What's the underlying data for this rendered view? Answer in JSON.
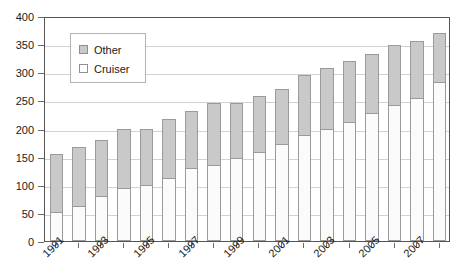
{
  "chart_data": {
    "type": "bar",
    "title": "",
    "subtitle": "",
    "xlabel": "",
    "ylabel": "",
    "stacked": true,
    "grid": true,
    "legend_position": "top-left-inside",
    "ylim": [
      0,
      400
    ],
    "ytick_labels": [
      "400",
      "350",
      "300",
      "250",
      "200",
      "150",
      "100",
      "50",
      "0"
    ],
    "ytick_values": [
      400,
      350,
      300,
      250,
      200,
      150,
      100,
      50,
      0
    ],
    "categories": [
      "1991",
      "1992",
      "1993",
      "1994",
      "1995",
      "1996",
      "1997",
      "1998",
      "1999",
      "2000",
      "2001",
      "2002",
      "2003",
      "2004",
      "2005",
      "2006",
      "2007",
      "2008"
    ],
    "visible_xtick_labels": [
      "1991",
      "1993",
      "1995",
      "1997",
      "1999",
      "2001",
      "2003",
      "2005",
      "2007"
    ],
    "series": [
      {
        "name": "Cruiser",
        "color": "#fbfbfb",
        "values": [
          52,
          62,
          80,
          95,
          100,
          112,
          130,
          135,
          148,
          158,
          172,
          188,
          200,
          212,
          228,
          242,
          255,
          283
        ]
      },
      {
        "name": "Other",
        "color": "#c9c9c9",
        "values": [
          103,
          105,
          100,
          105,
          100,
          105,
          102,
          110,
          97,
          100,
          98,
          107,
          107,
          108,
          105,
          106,
          100,
          87
        ]
      }
    ],
    "totals": [
      155,
      167,
      180,
      200,
      200,
      217,
      232,
      245,
      245,
      258,
      270,
      295,
      307,
      320,
      333,
      348,
      355,
      370
    ]
  },
  "legend": {
    "items": [
      {
        "label": "Other",
        "swatch": "gray-filled-square"
      },
      {
        "label": "Cruiser",
        "swatch": "white-filled-square"
      }
    ]
  }
}
